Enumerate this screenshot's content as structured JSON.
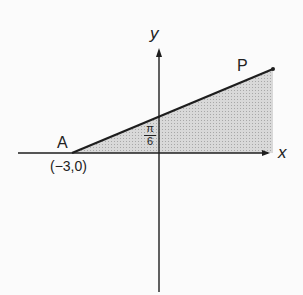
{
  "diagram": {
    "axes": {
      "x_label": "x",
      "y_label": "y"
    },
    "points": {
      "A": {
        "label": "A",
        "coord_label": "(−3,0)"
      },
      "P": {
        "label": "P"
      }
    },
    "angle": {
      "numerator": "π",
      "denominator": "6"
    },
    "colors": {
      "line": "#1e1e1e",
      "shade": "#cfcfcf",
      "background": "#fbfbfb"
    }
  }
}
